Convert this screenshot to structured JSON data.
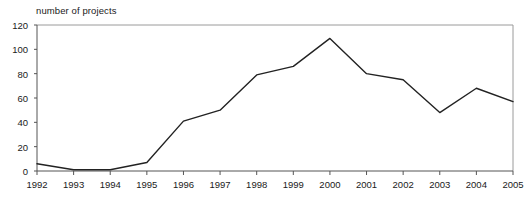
{
  "chart_data": {
    "type": "line",
    "title": "",
    "ylabel": "number of projects",
    "xlabel": "",
    "ylim": [
      0,
      120
    ],
    "yticks": [
      0,
      20,
      40,
      60,
      80,
      100,
      120
    ],
    "grid": false,
    "legend": null,
    "line_color": "#222222",
    "frame_color": "#9a9a9a",
    "categories": [
      "1992",
      "1993",
      "1994",
      "1995",
      "1996",
      "1997",
      "1998",
      "1999",
      "2000",
      "2001",
      "2002",
      "2003",
      "2004",
      "2005"
    ],
    "values": [
      6,
      1,
      1,
      7,
      41,
      50,
      79,
      86,
      109,
      80,
      75,
      48,
      68,
      57
    ]
  }
}
